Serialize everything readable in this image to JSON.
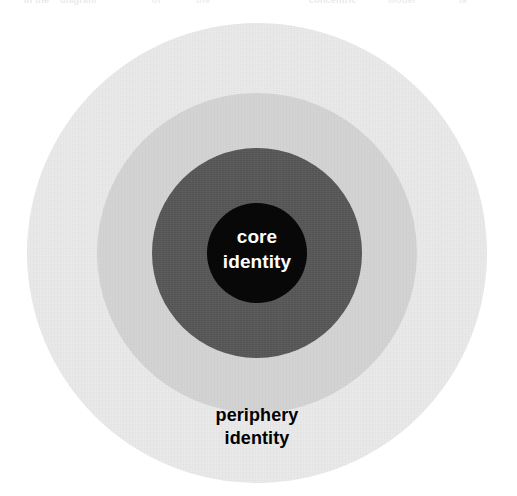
{
  "figure": {
    "width": 517,
    "height": 496,
    "background": "#ffffff",
    "type": "concentric-circles"
  },
  "scan_remnant": {
    "description": "faint clipped text from the line above, at the top page edge",
    "fragments": [
      {
        "text": "in the",
        "left": 24,
        "opacity": 0.16
      },
      {
        "text": "diagram",
        "left": 60,
        "opacity": 0.14
      },
      {
        "text": "of",
        "left": 152,
        "opacity": 0.13
      },
      {
        "text": "the",
        "left": 196,
        "opacity": 0.12
      },
      {
        "text": "concentric",
        "left": 309,
        "opacity": 0.15
      },
      {
        "text": "model",
        "left": 388,
        "opacity": 0.13
      },
      {
        "text": "is",
        "left": 459,
        "opacity": 0.14
      }
    ]
  },
  "chart_data": {
    "type": "concentric-circles",
    "title": "",
    "center": {
      "x": 257,
      "y": 253
    },
    "rings": [
      {
        "name": "periphery",
        "level": 4,
        "label": "periphery\nidentity",
        "radius": 230,
        "color": "#eaeaea",
        "text_color": "#000000",
        "textured": true
      },
      {
        "name": "outer-middle",
        "level": 3,
        "label": "",
        "radius": 160,
        "color": "#d4d4d4",
        "text_color": "#000000",
        "textured": true
      },
      {
        "name": "inner-middle",
        "level": 2,
        "label": "",
        "radius": 105,
        "color": "#585858",
        "text_color": "#ffffff",
        "textured": true
      },
      {
        "name": "core",
        "level": 1,
        "label": "core\nidentity",
        "radius": 50,
        "color": "#080808",
        "text_color": "#ffffff",
        "textured": false
      }
    ],
    "legend": null,
    "annotations": [
      {
        "text": "core identity",
        "position": "center"
      },
      {
        "text": "periphery identity",
        "position": "outer-ring-bottom"
      }
    ]
  },
  "labels": {
    "core": "core\nidentity",
    "periphery": "periphery\nidentity"
  }
}
